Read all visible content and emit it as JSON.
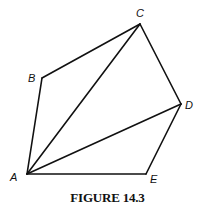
{
  "figure": {
    "caption": "FIGURE 14.3",
    "vertices": [
      {
        "id": "A",
        "label": "A",
        "x": 27,
        "y": 174,
        "lx": 10,
        "ly": 181
      },
      {
        "id": "B",
        "label": "B",
        "x": 42,
        "y": 78,
        "lx": 28,
        "ly": 82
      },
      {
        "id": "C",
        "label": "C",
        "x": 140,
        "y": 24,
        "lx": 136,
        "ly": 17
      },
      {
        "id": "D",
        "label": "D",
        "x": 181,
        "y": 104,
        "lx": 185,
        "ly": 109
      },
      {
        "id": "E",
        "label": "E",
        "x": 146,
        "y": 174,
        "lx": 150,
        "ly": 183
      }
    ],
    "polygon_edges": [
      [
        "A",
        "B"
      ],
      [
        "B",
        "C"
      ],
      [
        "C",
        "D"
      ],
      [
        "D",
        "E"
      ],
      [
        "E",
        "A"
      ]
    ],
    "diagonals": [
      [
        "A",
        "C"
      ],
      [
        "A",
        "D"
      ]
    ],
    "colors": {
      "stroke": "#111111",
      "background": "#ffffff"
    }
  }
}
